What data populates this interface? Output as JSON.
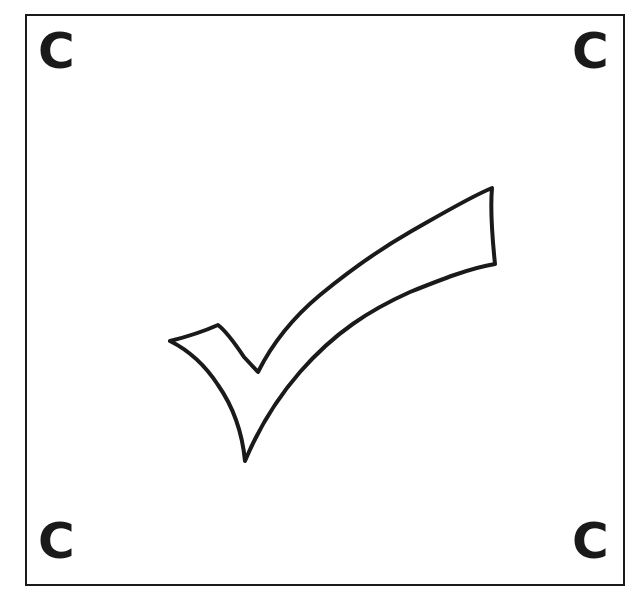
{
  "frame": {
    "border_color": "#1a1a1a",
    "background": "#ffffff"
  },
  "corners": {
    "top_left": "C",
    "top_right": "C",
    "bottom_left": "C",
    "bottom_right": "C"
  },
  "center_icon": {
    "name": "checkmark-icon",
    "style": "hand-drawn outline",
    "stroke_color": "#1a1a1a",
    "fill_color": "#ffffff"
  }
}
